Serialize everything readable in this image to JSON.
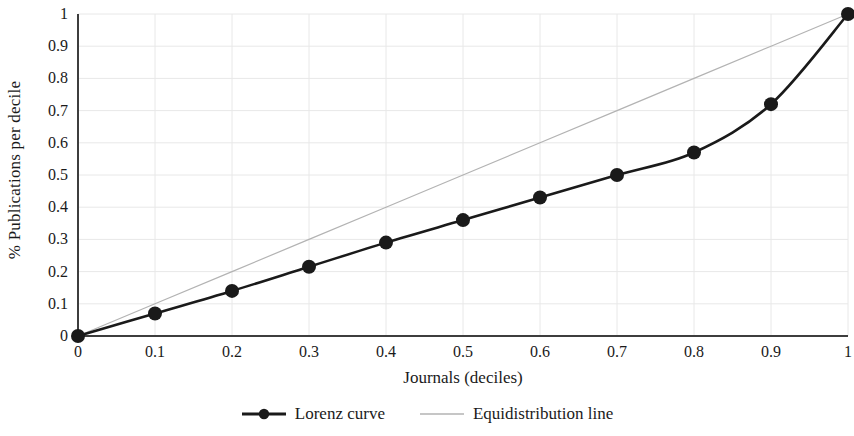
{
  "chart_data": {
    "type": "line",
    "title": "",
    "xlabel": "Journals (deciles)",
    "ylabel": "% Publications per decile",
    "xlim": [
      0,
      1
    ],
    "ylim": [
      0,
      1
    ],
    "grid": true,
    "legend_position": "bottom",
    "x_ticks": [
      "0",
      "0.1",
      "0.2",
      "0.3",
      "0.4",
      "0.5",
      "0.6",
      "0.7",
      "0.8",
      "0.9",
      "1"
    ],
    "y_ticks": [
      "0",
      "0.1",
      "0.2",
      "0.3",
      "0.4",
      "0.5",
      "0.6",
      "0.7",
      "0.8",
      "0.9",
      "1"
    ],
    "x": [
      0,
      0.1,
      0.2,
      0.3,
      0.4,
      0.5,
      0.6,
      0.7,
      0.8,
      0.9,
      1
    ],
    "series": [
      {
        "name": "Lorenz curve",
        "color": "#1a1a1a",
        "line_width": 2.6,
        "marker": "circle",
        "marker_size": 7,
        "values": [
          0,
          0.07,
          0.14,
          0.215,
          0.29,
          0.36,
          0.43,
          0.5,
          0.57,
          0.72,
          1.0
        ]
      },
      {
        "name": "Equidistribution line",
        "color": "#b3b3b3",
        "line_width": 1.2,
        "marker": "none",
        "marker_size": 0,
        "values": [
          0,
          0.1,
          0.2,
          0.3,
          0.4,
          0.5,
          0.6,
          0.7,
          0.8,
          0.9,
          1.0
        ]
      }
    ]
  },
  "axes": {
    "axis_color": "#3d3d3d",
    "grid_color": "#e8e8e8"
  },
  "legend": {
    "items": [
      {
        "label": "Lorenz curve"
      },
      {
        "label": "Equidistribution line"
      }
    ]
  }
}
